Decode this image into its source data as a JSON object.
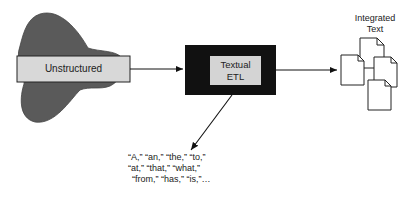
{
  "diagram": {
    "source": {
      "label": "Unstructured",
      "box_fill": "#d8d8d8",
      "blob_fill": "#5a5a5a"
    },
    "process": {
      "label_line1": "Textual",
      "label_line2": "ETL",
      "outer_fill": "#111111",
      "inner_fill": "#d4d4d4"
    },
    "output": {
      "label_line1": "Integrated",
      "label_line2": "Text",
      "document_count": 4
    },
    "stop_words": {
      "line1": "“A,” “an,” “the,” “to,”",
      "line2": "“at,” “that,” “what,”",
      "line3": "“from,” “has,” “is,”…"
    },
    "edges": [
      {
        "from": "Unstructured",
        "to": "Textual ETL"
      },
      {
        "from": "Textual ETL",
        "to": "Integrated Text"
      },
      {
        "from": "Textual ETL",
        "to": "stop words"
      }
    ]
  }
}
